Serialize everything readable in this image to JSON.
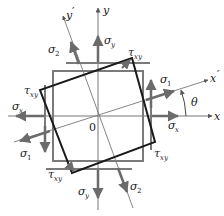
{
  "figure": {
    "colors": {
      "axis": "#6b6b6b",
      "original_element": "#7a7a7a",
      "rotated_element": "#1a1a1a",
      "arrow": "#6b6b6b",
      "text": "#222222"
    },
    "axes": {
      "x": "x",
      "y": "y",
      "x_prime": "x",
      "y_prime": "y",
      "prime": "′",
      "origin": "0",
      "angle": "θ"
    },
    "stresses": {
      "sigma": "σ",
      "tau": "τ",
      "sub_x": "x",
      "sub_y": "y",
      "sub_xy": "xy",
      "sub_1": "1",
      "sub_2": "2"
    }
  }
}
